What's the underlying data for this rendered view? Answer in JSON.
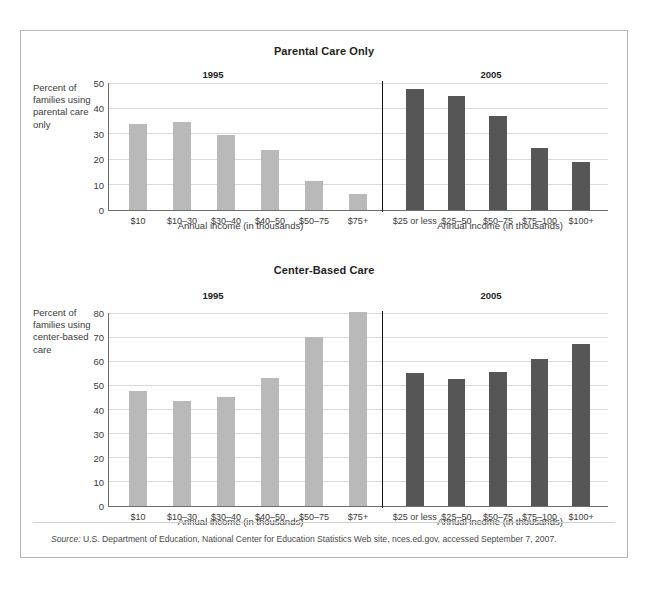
{
  "figure": {
    "source_prefix": "Source:",
    "source_text": " U.S. Department of Education, National Center for Education Statistics Web site, nces.ed.gov, accessed September 7, 2007."
  },
  "colors": {
    "bar_1995": "#b9b9b9",
    "bar_2005": "#565656",
    "gridline": "#d9d9d9",
    "divider": "#111111",
    "border": "#b5b5b5"
  },
  "chart_data": [
    {
      "type": "bar",
      "title": "Parental Care Only",
      "ylabel": "Percent of families using parental care only",
      "xlabel": "Annual income (in thousands)",
      "ylim": [
        0,
        50
      ],
      "yticks": [
        0,
        10,
        20,
        30,
        40,
        50
      ],
      "grid": true,
      "legend": "none",
      "panels": [
        {
          "name": "1995",
          "xlabel": "Annual income (in thousands)",
          "categories": [
            "$10",
            "$10–30",
            "$30–40",
            "$40–50",
            "$50–75",
            "$75+"
          ],
          "values": [
            34,
            34.5,
            29.5,
            23.5,
            11.5,
            6.5
          ]
        },
        {
          "name": "2005",
          "xlabel": "Annual income (in thousands)",
          "categories": [
            "$25 or less",
            "$25–50",
            "$50–75",
            "$75–100",
            "$100+"
          ],
          "values": [
            47.5,
            45,
            37,
            24.5,
            19
          ]
        }
      ]
    },
    {
      "type": "bar",
      "title": "Center-Based Care",
      "ylabel": "Percent of families using center-based care",
      "xlabel": "Annual income (in thousands)",
      "ylim": [
        0,
        80
      ],
      "yticks": [
        0,
        10,
        20,
        30,
        40,
        50,
        60,
        70,
        80
      ],
      "grid": true,
      "legend": "none",
      "panels": [
        {
          "name": "1995",
          "xlabel": "Annual income (in thousands)",
          "categories": [
            "$10",
            "$10–30",
            "$30–40",
            "$40–50",
            "$50–75",
            "$75+"
          ],
          "values": [
            47.5,
            43.5,
            45,
            53,
            70,
            80.5
          ]
        },
        {
          "name": "2005",
          "xlabel": "Annual income (in thousands)",
          "categories": [
            "$25 or less",
            "$25–50",
            "$50–75",
            "$75–100",
            "$100+"
          ],
          "values": [
            55,
            52.5,
            55.5,
            61,
            67
          ]
        }
      ]
    }
  ]
}
